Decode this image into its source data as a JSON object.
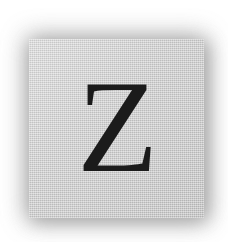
{
  "scene": {
    "description": "scanned square letter tile on white background",
    "background_color": "#ffffff"
  },
  "tile": {
    "face_color": "#cccccc",
    "shadow_color": "#8e8e8e",
    "shape": "square",
    "surface": "textured paper"
  },
  "glyph": {
    "character": "Z",
    "ink_color": "#1b1b1b",
    "style": "serif capital"
  }
}
